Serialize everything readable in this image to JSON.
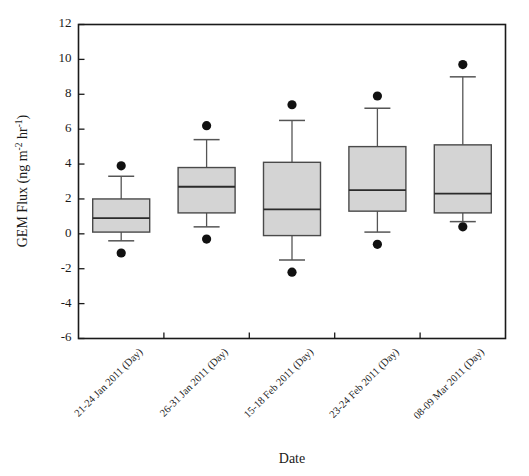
{
  "chart_data": {
    "type": "box",
    "title": "",
    "xlabel": "Date",
    "ylabel": "GEM Flux (ng m-2 hr-1)",
    "ylabel_parts": {
      "prefix": "GEM Flux (ng m",
      "sup1": "-2",
      "mid": " hr",
      "sup2": "-1",
      "suffix": ")"
    },
    "ylim": [
      -6,
      12
    ],
    "yticks": [
      12,
      10,
      8,
      6,
      4,
      2,
      0,
      -2,
      -4,
      -6
    ],
    "ytick_labels": [
      "12",
      "10",
      "8",
      "6",
      "4",
      "2",
      "0",
      "-2",
      "-4",
      "-6"
    ],
    "grid": false,
    "legend": "none",
    "categories": [
      "21-24 Jan 2011 (Day)",
      "26-31 Jan 2011 (Day)",
      "15-18 Feb 2011 (Day)",
      "23-24 Feb 2011 (Day)",
      "08-09 Mar 2011 (Day)"
    ],
    "boxes": [
      {
        "category": "21-24 Jan 2011 (Day)",
        "whisker_low": -0.4,
        "q1": 0.1,
        "median": 0.9,
        "q3": 2.0,
        "whisker_high": 3.3,
        "outliers": [
          3.9,
          -1.1
        ]
      },
      {
        "category": "26-31 Jan 2011 (Day)",
        "whisker_low": 0.4,
        "q1": 1.2,
        "median": 2.7,
        "q3": 3.8,
        "whisker_high": 5.4,
        "outliers": [
          6.2,
          -0.3
        ]
      },
      {
        "category": "15-18 Feb 2011 (Day)",
        "whisker_low": -1.5,
        "q1": -0.1,
        "median": 1.4,
        "q3": 4.1,
        "whisker_high": 6.5,
        "outliers": [
          7.4,
          -2.2
        ]
      },
      {
        "category": "23-24 Feb 2011 (Day)",
        "whisker_low": 0.1,
        "q1": 1.3,
        "median": 2.5,
        "q3": 5.0,
        "whisker_high": 7.2,
        "outliers": [
          7.9,
          -0.6
        ]
      },
      {
        "category": "08-09 Mar 2011 (Day)",
        "whisker_low": 0.7,
        "q1": 1.2,
        "median": 2.3,
        "q3": 5.1,
        "whisker_high": 9.0,
        "outliers": [
          9.7,
          0.4
        ]
      }
    ],
    "colors": {
      "box_fill": "#d4d4d4",
      "box_stroke": "#4a4a4a",
      "median": "#2b2b2b",
      "whisker": "#555555",
      "outlier": "#111111",
      "frame": "#1a1a1a",
      "background": "#ffffff"
    }
  }
}
